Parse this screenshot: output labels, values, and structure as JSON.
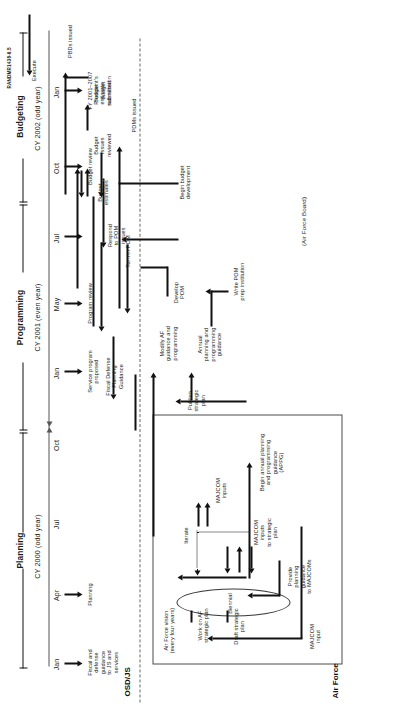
{
  "figure": {
    "rand_id": "RANDMR1438-6.5",
    "phases": [
      {
        "label": "Planning"
      },
      {
        "label": "Programming"
      },
      {
        "label": "Budgeting"
      }
    ],
    "years": [
      {
        "label": "CY 2000 (odd year)"
      },
      {
        "label": "CY 2001 (even year)"
      },
      {
        "label": "CY 2002 (odd year)"
      }
    ],
    "months": [
      "Jan",
      "Apr",
      "Jul",
      "Oct",
      "Jan",
      "May",
      "Jul",
      "Oct",
      "Jan"
    ],
    "lanes": {
      "osd_js": "OSD/JS",
      "air_force": "Air Force"
    },
    "osd_events": [
      {
        "label": "Fiscal and\ndefense\nguidance\nto JS and\nservices"
      },
      {
        "label": "Planning"
      },
      {
        "label": "Service program\nproposed"
      },
      {
        "label": "Program review"
      },
      {
        "label": "Budget review"
      },
      {
        "label": "FY 2001–2007\nPresident's\nbudget\nsubmission"
      }
    ],
    "osd_flow_labels": [
      {
        "label": "Fiscal Defense\nPlanning\nGuidance"
      },
      {
        "label": "Respond\nto POM\nissues"
      },
      {
        "label": "Budget\nestimates"
      },
      {
        "label": "Budget\nissues\nreviewed"
      },
      {
        "label": "Budget\nestimate\nsubmitted"
      },
      {
        "label": "PDMs issued"
      },
      {
        "label": "PBDs issued"
      },
      {
        "label": "Execute"
      }
    ],
    "af_events": [
      {
        "label": "Air Force vision\n(every four years)"
      },
      {
        "label": "Work on AF\nstrategic plan"
      },
      {
        "label": "Draft strategic\nplan"
      },
      {
        "label": "Biennial"
      },
      {
        "label": "MAJCOM\ninput"
      },
      {
        "label": "Provide\nplanning\nguidance\nto MAJCOMs"
      },
      {
        "label": "MAJCOM\ninputs\nto strategic\nplan"
      },
      {
        "label": "Iterate"
      },
      {
        "label": "MAJCOM\ninputs"
      },
      {
        "label": "Begin annual planning\nand programming\nguidance\n(APPG)"
      },
      {
        "label": "Publish\nstrategic\nplan"
      },
      {
        "label": "Annual\nplanning and\nprogramming\nguidance"
      },
      {
        "label": "Modify AF\nguidance and\nprogramming"
      },
      {
        "label": "Write POM\nprep institution"
      },
      {
        "label": "Develop\nPOM"
      },
      {
        "label": "Turn in POM"
      },
      {
        "label": "Begin budget\ndevelopment"
      },
      {
        "label": "(Air Force Board)"
      }
    ],
    "colors": {
      "ink": "#1c1c1c",
      "rule": "#4a4a4a",
      "dashed": "#666666",
      "background": "#ffffff"
    }
  }
}
